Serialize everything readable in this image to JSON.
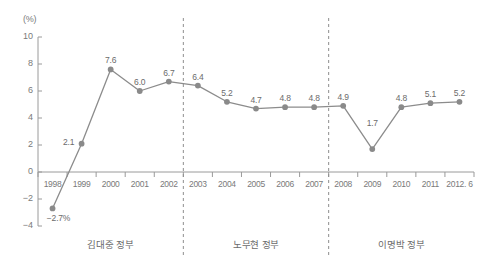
{
  "chart_data": {
    "type": "line",
    "title": "",
    "xlabel": "",
    "ylabel": "(%)",
    "unit_label": "(%)",
    "categories": [
      "1998",
      "1999",
      "2000",
      "2001",
      "2002",
      "2003",
      "2004",
      "2005",
      "2006",
      "2007",
      "2008",
      "2009",
      "2010",
      "2011",
      "2012. 6"
    ],
    "values": [
      -2.7,
      2.1,
      7.6,
      6.0,
      6.7,
      6.4,
      5.2,
      4.7,
      4.8,
      4.8,
      4.9,
      1.7,
      4.8,
      5.1,
      5.2
    ],
    "point_labels": [
      "-2.7%",
      "2.1",
      "7.6",
      "6.0",
      "6.7",
      "6.4",
      "5.2",
      "4.7",
      "4.8",
      "4.8",
      "4.9",
      "1.7",
      "4.8",
      "5.1",
      "5.2"
    ],
    "ylim": [
      -4,
      10
    ],
    "yticks": [
      10,
      8,
      6,
      4,
      2,
      0,
      -2,
      -4
    ],
    "ytick_labels": [
      "10",
      "8",
      "6",
      "4",
      "2",
      "0",
      "-2",
      "-4"
    ],
    "grid": false,
    "legend": "none",
    "series_color": "#8c8c8c",
    "marker_color": "#8a8a8a",
    "axis_color": "#9a9a9a",
    "text_color": "#6f6f6f",
    "annotations": [
      {
        "label": "김대중 정부",
        "from": "1998",
        "to": "2002"
      },
      {
        "label": "노무현 정부",
        "from": "2003",
        "to": "2007"
      },
      {
        "label": "이명박 정부",
        "from": "2008",
        "to": "2012. 6"
      }
    ],
    "dividers": [
      {
        "after_category": "2002"
      },
      {
        "after_category": "2007"
      }
    ]
  },
  "eras": [
    {
      "name": "era-kim-dae-jung",
      "label": "김대중 정부"
    },
    {
      "name": "era-roh-moo-hyun",
      "label": "노무현 정부"
    },
    {
      "name": "era-lee-myung-bak",
      "label": "이명박 정부"
    }
  ]
}
